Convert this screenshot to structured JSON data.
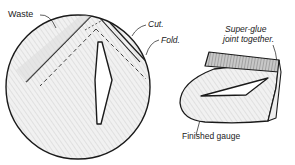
{
  "diagram": {
    "type": "technical-illustration",
    "colors": {
      "ink": "#1a1a1a",
      "shading": "#e6e6e6",
      "shading_dark": "#9a9a9a",
      "background": "#ffffff"
    },
    "labels": {
      "waste": "Waste",
      "cut": "Cut.",
      "fold": "Fold.",
      "glue_line1": "Super-glue",
      "glue_line2": "joint together.",
      "finished": "Finished gauge"
    },
    "parts": [
      {
        "name": "paper-disc",
        "description": "Circular blank with V-shaped cut and fold lines and central slot"
      },
      {
        "name": "finished-gauge",
        "description": "Folded disc forming a 3D gauge with triangular window"
      }
    ]
  }
}
